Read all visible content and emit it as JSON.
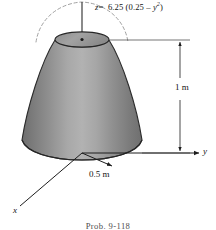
{
  "figure": {
    "title_caption": "Prob. 9-118",
    "equation": {
      "lhs": "z",
      "equals": "=",
      "rhs_prefix": "6.25 (0.25 – ",
      "rhs_variable": "y",
      "rhs_exponent": "2",
      "rhs_suffix": ")",
      "full_text": "z = 6.25 (0.25 – y²)"
    },
    "dimensions": {
      "height_label": "1 m",
      "radius_label": "0.5 m"
    },
    "axes": {
      "x_label": "x",
      "y_label": "y",
      "z_label": "z"
    },
    "colors": {
      "body_light": "#b4b4b4",
      "body_mid": "#8e8e8e",
      "body_dark": "#656565",
      "top_face": "#9b9b9b",
      "outline": "#2b2b2b",
      "dashed_curve": "#8c8c8c",
      "background": "#ffffff",
      "caption_text": "#4d4d4d"
    },
    "shape": {
      "type": "solid-of-revolution",
      "description": "paraboloid frustum generated by z = 6.25 (0.25 - y^2) revolved about the z axis",
      "base_radius_m": 0.5,
      "height_m": 1.0
    }
  }
}
